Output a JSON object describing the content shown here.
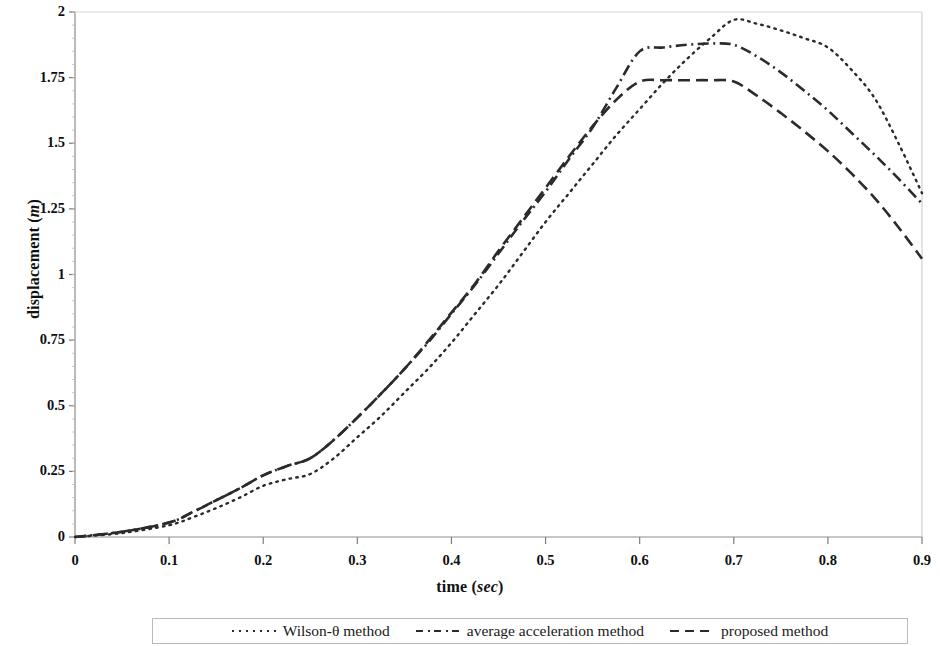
{
  "chart_data": {
    "type": "line",
    "title": "",
    "xlabel": "time (sec)",
    "xlabel_plain": "time",
    "xlabel_unit": "sec",
    "ylabel": "displacement (m)",
    "ylabel_plain": "displacement",
    "ylabel_unit": "m",
    "xlim": [
      0,
      0.9
    ],
    "ylim": [
      0,
      2
    ],
    "xticks": [
      "0",
      "0.1",
      "0.2",
      "0.3",
      "0.4",
      "0.5",
      "0.6",
      "0.7",
      "0.8",
      "0.9"
    ],
    "xtick_values": [
      0,
      0.1,
      0.2,
      0.3,
      0.4,
      0.5,
      0.6,
      0.7,
      0.8,
      0.9
    ],
    "yticks": [
      "0",
      "0.25",
      "0.5",
      "0.75",
      "1",
      "1.25",
      "1.5",
      "1.75",
      "2"
    ],
    "ytick_values": [
      0,
      0.25,
      0.5,
      0.75,
      1,
      1.25,
      1.5,
      1.75,
      2
    ],
    "grid": false,
    "legend_position": "bottom",
    "x": [
      0,
      0.05,
      0.1,
      0.125,
      0.15,
      0.175,
      0.2,
      0.225,
      0.25,
      0.275,
      0.3,
      0.325,
      0.35,
      0.375,
      0.4,
      0.425,
      0.45,
      0.475,
      0.5,
      0.525,
      0.55,
      0.575,
      0.6,
      0.625,
      0.65,
      0.675,
      0.7,
      0.725,
      0.75,
      0.775,
      0.8,
      0.825,
      0.85,
      0.875,
      0.9
    ],
    "series": [
      {
        "name": "Wilson-θ method",
        "style": "dotted",
        "color": "#2b2b2b",
        "values": [
          0.0,
          0.015,
          0.045,
          0.075,
          0.11,
          0.15,
          0.195,
          0.22,
          0.24,
          0.3,
          0.38,
          0.46,
          0.55,
          0.64,
          0.74,
          0.85,
          0.96,
          1.08,
          1.2,
          1.31,
          1.42,
          1.53,
          1.63,
          1.73,
          1.82,
          1.9,
          1.97,
          1.955,
          1.93,
          1.9,
          1.865,
          1.78,
          1.67,
          1.5,
          1.31
        ]
      },
      {
        "name": "average acceleration method",
        "style": "dash-dot",
        "color": "#2b2b2b",
        "values": [
          0.0,
          0.02,
          0.055,
          0.095,
          0.14,
          0.185,
          0.235,
          0.27,
          0.3,
          0.37,
          0.455,
          0.545,
          0.64,
          0.74,
          0.85,
          0.96,
          1.08,
          1.2,
          1.315,
          1.44,
          1.56,
          1.71,
          1.85,
          1.865,
          1.875,
          1.88,
          1.875,
          1.83,
          1.77,
          1.7,
          1.625,
          1.54,
          1.455,
          1.365,
          1.27
        ]
      },
      {
        "name": "proposed method",
        "style": "dashed",
        "color": "#2b2b2b",
        "values": [
          0.0,
          0.02,
          0.055,
          0.095,
          0.14,
          0.185,
          0.235,
          0.27,
          0.3,
          0.37,
          0.455,
          0.545,
          0.64,
          0.745,
          0.855,
          0.965,
          1.09,
          1.21,
          1.33,
          1.45,
          1.565,
          1.665,
          1.735,
          1.74,
          1.74,
          1.74,
          1.735,
          1.68,
          1.615,
          1.545,
          1.47,
          1.385,
          1.29,
          1.18,
          1.06
        ]
      }
    ]
  },
  "axes": {
    "y_title_plain": "displacement (",
    "y_title_italic": "m",
    "y_title_tail": ")",
    "x_title_plain": "time (",
    "x_title_italic": "sec",
    "x_title_tail": ")"
  },
  "legend": {
    "entries": [
      {
        "label": "Wilson-θ method",
        "style": "dotted"
      },
      {
        "label": "average acceleration method",
        "style": "dash-dot"
      },
      {
        "label": "proposed method",
        "style": "dashed"
      }
    ]
  }
}
